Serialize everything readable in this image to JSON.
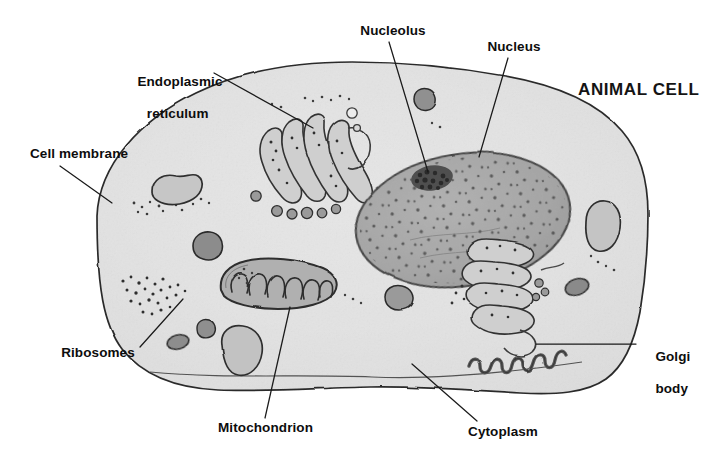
{
  "diagram": {
    "title": "ANIMAL CELL",
    "style": "hand-drawn grayscale textbook illustration",
    "background_color": "#ffffff",
    "ink_color": "#262626"
  },
  "palette": {
    "cytoplasm_fill": "#e9e9e9",
    "cytoplasm_fill_light": "#f2f2f2",
    "membrane_stroke": "#2b2b2b",
    "nucleus_fill": "#a8a8a8",
    "nucleus_stroke": "#4a4a4a",
    "nucleolus_fill": "#4d4d4d",
    "organelle_fill": "#b4b4b4",
    "organelle_dark_fill": "#8e8e8e",
    "er_fill": "#cfcfcf",
    "er_stroke": "#3a3a3a",
    "golgi_stroke": "#555555",
    "label_color": "#0d0d0d",
    "leader_color": "#1a1a1a"
  },
  "labels": [
    {
      "id": "endoplasmic-reticulum",
      "lines": [
        "Endoplasmic",
        "reticulum"
      ],
      "text": "Endoplasmic reticulum",
      "align": "center",
      "x": 122,
      "y": 58,
      "width": 96,
      "leader": {
        "x1": 214,
        "y1": 73,
        "x2": 313,
        "y2": 128
      }
    },
    {
      "id": "cell-membrane",
      "lines": [
        "Cell membrane"
      ],
      "text": "Cell membrane",
      "align": "center",
      "x": 30,
      "y": 146,
      "width": 94,
      "leader": {
        "x1": 60,
        "y1": 166,
        "x2": 112,
        "y2": 203
      }
    },
    {
      "id": "nucleolus",
      "lines": [
        "Nucleolus"
      ],
      "text": "Nucleolus",
      "align": "center",
      "x": 360,
      "y": 23,
      "width": 66,
      "leader": {
        "x1": 389,
        "y1": 42,
        "x2": 428,
        "y2": 172
      }
    },
    {
      "id": "nucleus",
      "lines": [
        "Nucleus"
      ],
      "text": "Nucleus",
      "align": "center",
      "x": 486,
      "y": 39,
      "width": 56,
      "leader": {
        "x1": 508,
        "y1": 58,
        "x2": 479,
        "y2": 157
      }
    },
    {
      "id": "ribosomes",
      "lines": [
        "Ribosomes"
      ],
      "text": "Ribosomes",
      "align": "center",
      "x": 59,
      "y": 345,
      "width": 78,
      "leader": {
        "x1": 140,
        "y1": 347,
        "x2": 183,
        "y2": 299
      }
    },
    {
      "id": "mitochondrion",
      "lines": [
        "Mitochondrion"
      ],
      "text": "Mitochondrion",
      "align": "center",
      "x": 218,
      "y": 420,
      "width": 94,
      "leader": {
        "x1": 265,
        "y1": 418,
        "x2": 290,
        "y2": 307
      }
    },
    {
      "id": "cytoplasm",
      "lines": [
        "Cytoplasm"
      ],
      "text": "Cytoplasm",
      "align": "center",
      "x": 466,
      "y": 424,
      "width": 74,
      "leader": {
        "x1": 477,
        "y1": 421,
        "x2": 412,
        "y2": 364
      }
    },
    {
      "id": "golgi-body",
      "lines": [
        "Golgi",
        "body"
      ],
      "text": "Golgi body",
      "align": "left",
      "x": 640,
      "y": 333,
      "width": 56,
      "leader": {
        "x1": 636,
        "y1": 344,
        "x2": 536,
        "y2": 344
      }
    }
  ],
  "structures": [
    {
      "id": "cell-membrane-outline",
      "name": "Cell membrane",
      "kind": "outline"
    },
    {
      "id": "cytoplasm-body",
      "name": "Cytoplasm",
      "kind": "fill"
    },
    {
      "id": "nucleus-body",
      "name": "Nucleus",
      "kind": "organelle"
    },
    {
      "id": "nucleolus-body",
      "name": "Nucleolus",
      "kind": "organelle"
    },
    {
      "id": "rough-er-left",
      "name": "Endoplasmic reticulum",
      "kind": "organelle"
    },
    {
      "id": "rough-er-right",
      "name": "Endoplasmic reticulum",
      "kind": "organelle"
    },
    {
      "id": "mitochondrion-body",
      "name": "Mitochondrion",
      "kind": "organelle"
    },
    {
      "id": "golgi-body-ribbon",
      "name": "Golgi body",
      "kind": "organelle"
    },
    {
      "id": "ribosome-cluster-upper",
      "name": "Ribosomes",
      "kind": "granules"
    },
    {
      "id": "ribosome-cluster-lower",
      "name": "Ribosomes",
      "kind": "granules"
    },
    {
      "id": "vacuole-upper-left",
      "name": "Vacuole",
      "kind": "organelle"
    },
    {
      "id": "vacuole-lower-left",
      "name": "Vacuole",
      "kind": "organelle"
    },
    {
      "id": "vacuole-right",
      "name": "Vacuole",
      "kind": "organelle"
    },
    {
      "id": "lysosome-a",
      "name": "Lysosome",
      "kind": "organelle"
    },
    {
      "id": "lysosome-b",
      "name": "Lysosome",
      "kind": "organelle"
    },
    {
      "id": "lysosome-c",
      "name": "Lysosome",
      "kind": "organelle"
    },
    {
      "id": "lysosome-d",
      "name": "Lysosome",
      "kind": "organelle"
    }
  ]
}
